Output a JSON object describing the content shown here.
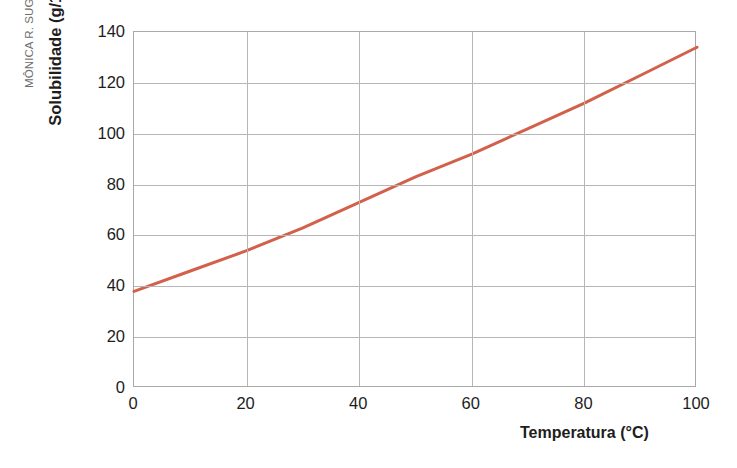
{
  "credit": {
    "text": "MÔNICA R. SUGUIYAMA/Acervo da editora"
  },
  "chart_data": {
    "type": "line",
    "title": "",
    "xlabel": "Temperatura (°C)",
    "ylabel": "Solubilidade (g/100 g de água)",
    "xlim": [
      0,
      100
    ],
    "ylim": [
      0,
      140
    ],
    "xticks": [
      0,
      20,
      40,
      60,
      80,
      100
    ],
    "yticks": [
      0,
      20,
      40,
      60,
      80,
      100,
      120,
      140
    ],
    "xtick_labels": [
      "0",
      "20",
      "40",
      "60",
      "80",
      "100"
    ],
    "ytick_labels": [
      "0",
      "20",
      "40",
      "60",
      "80",
      "100",
      "120",
      "140"
    ],
    "grid": true,
    "legend": "none",
    "series": [
      {
        "name": "Solubilidade",
        "color": "#d2604a",
        "line_width": 3,
        "x": [
          0,
          10,
          20,
          30,
          40,
          50,
          60,
          70,
          80,
          90,
          100
        ],
        "values": [
          38,
          46,
          54,
          63,
          73,
          83,
          92,
          102,
          112,
          123,
          134
        ]
      }
    ]
  }
}
